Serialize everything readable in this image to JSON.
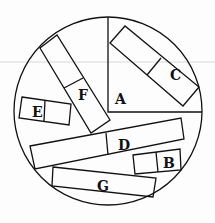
{
  "diagram": {
    "stroke_color": "#111111",
    "background": "#fdfdfd",
    "artifact_line_color": "#d8d8d8",
    "circle": {
      "cx": 108,
      "cy": 111,
      "r": 94
    },
    "sector_A": {
      "label": "A",
      "label_pos": [
        115,
        104
      ],
      "vertex": [
        108,
        112
      ],
      "top": [
        108,
        17
      ],
      "right": [
        202,
        112
      ]
    },
    "shapes": [
      {
        "id": "C",
        "label": "C",
        "points": [
          [
            110,
            43
          ],
          [
            125,
            26
          ],
          [
            199,
            87
          ],
          [
            183,
            106
          ]
        ],
        "divider": [
          [
            161,
            58
          ],
          [
            147,
            75
          ]
        ],
        "label_pos": [
          170,
          80
        ]
      },
      {
        "id": "F",
        "label": "F",
        "points": [
          [
            40,
            48
          ],
          [
            57,
            35
          ],
          [
            110,
            120
          ],
          [
            91,
            133
          ]
        ],
        "divider": [
          [
            64,
            88
          ],
          [
            83,
            78
          ]
        ],
        "label_pos": [
          78,
          100
        ]
      },
      {
        "id": "E",
        "label": "E",
        "points": [
          [
            22,
            97
          ],
          [
            71,
            104
          ],
          [
            69,
            125
          ],
          [
            19,
            118
          ]
        ],
        "divider": [
          [
            45,
            100
          ],
          [
            44,
            121
          ]
        ],
        "label_pos": [
          32,
          117
        ]
      },
      {
        "id": "D",
        "label": "D",
        "points": [
          [
            30,
            146
          ],
          [
            181,
            118
          ],
          [
            184,
            139
          ],
          [
            35,
            169
          ]
        ],
        "divider": [
          [
            106,
            133
          ],
          [
            108,
            155
          ]
        ],
        "label_pos": [
          118,
          150
        ]
      },
      {
        "id": "B",
        "label": "B",
        "points": [
          [
            133,
            155
          ],
          [
            180,
            149
          ],
          [
            181,
            170
          ],
          [
            135,
            174
          ]
        ],
        "divider": [
          [
            156,
            152
          ],
          [
            158,
            172
          ]
        ],
        "label_pos": [
          163,
          168
        ]
      },
      {
        "id": "G",
        "label": "G",
        "points": [
          [
            53,
            167
          ],
          [
            156,
            178
          ],
          [
            153,
            197
          ],
          [
            52,
            186
          ]
        ],
        "divider": null,
        "label_pos": [
          97,
          191
        ]
      }
    ]
  }
}
